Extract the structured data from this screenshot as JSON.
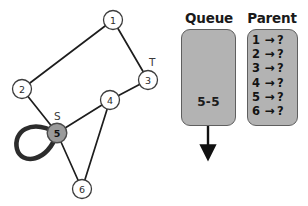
{
  "graph": {
    "title": "bfs-graph",
    "node_radius": 9.5,
    "start_node": "5",
    "target_node": "3",
    "start_label": "S",
    "target_label": "T",
    "edge_color": "#1a1a1a",
    "node_fill": "#ffffff",
    "active_node_fill": "#9a9a9a",
    "nodes": [
      {
        "id": "1",
        "label": "1",
        "x": 113,
        "y": 20,
        "state": "unvisited"
      },
      {
        "id": "2",
        "label": "2",
        "x": 22,
        "y": 89,
        "state": "unvisited"
      },
      {
        "id": "3",
        "label": "3",
        "x": 148,
        "y": 80,
        "state": "unvisited"
      },
      {
        "id": "4",
        "label": "4",
        "x": 110,
        "y": 100,
        "state": "unvisited"
      },
      {
        "id": "5",
        "label": "5",
        "x": 57,
        "y": 133,
        "state": "active"
      },
      {
        "id": "6",
        "label": "6",
        "x": 82,
        "y": 189,
        "state": "unvisited"
      }
    ],
    "edges": [
      {
        "from": "1",
        "to": "2"
      },
      {
        "from": "1",
        "to": "3"
      },
      {
        "from": "3",
        "to": "4"
      },
      {
        "from": "2",
        "to": "5"
      },
      {
        "from": "4",
        "to": "5"
      },
      {
        "from": "4",
        "to": "6"
      },
      {
        "from": "5",
        "to": "6"
      }
    ],
    "self_loop": {
      "node": "5",
      "direction": "left-down"
    }
  },
  "queue": {
    "title": "Queue",
    "contents": "5-5",
    "arrow": "down-arrow"
  },
  "parent": {
    "title": "Parent",
    "arrow_glyph": "→",
    "rows": [
      {
        "key": "1",
        "value": "?"
      },
      {
        "key": "2",
        "value": "?"
      },
      {
        "key": "3",
        "value": "?"
      },
      {
        "key": "4",
        "value": "?"
      },
      {
        "key": "5",
        "value": "?"
      },
      {
        "key": "6",
        "value": "?"
      }
    ]
  },
  "colors": {
    "panel_fill": "#b3b3b3",
    "panel_border": "#5f5f5f",
    "ink": "#1a1a1a",
    "active_node": "#9a9a9a"
  }
}
